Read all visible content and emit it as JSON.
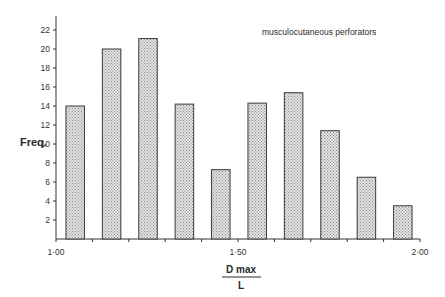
{
  "chart_data": {
    "type": "bar",
    "title": "",
    "annotation": "musculocutaneous perforators",
    "ylabel": "Freq.",
    "xlabel": {
      "numerator": "D max",
      "denominator": "L"
    },
    "x_tick_labels": [
      "1·00",
      "1·50",
      "2·00"
    ],
    "x_range": [
      1.0,
      2.0
    ],
    "y_ticks": [
      2,
      4,
      6,
      8,
      10,
      12,
      14,
      16,
      18,
      20,
      22
    ],
    "ylim": [
      0,
      23
    ],
    "grid": false,
    "legend_position": "top-right",
    "bar_fill": "crosshatch-gray",
    "categories": [
      "1.00-1.10",
      "1.10-1.20",
      "1.20-1.30",
      "1.30-1.40",
      "1.40-1.50",
      "1.50-1.60",
      "1.60-1.70",
      "1.70-1.80",
      "1.80-1.90",
      "1.90-2.00"
    ],
    "values": [
      14,
      20,
      21.1,
      14.2,
      7.3,
      14.3,
      15.4,
      11.4,
      6.5,
      3.5
    ]
  },
  "colors": {
    "bar_fill": "#c8c8c8",
    "bar_stroke": "#3a3a3a",
    "axis": "#333333",
    "text": "#2a2a2a"
  }
}
